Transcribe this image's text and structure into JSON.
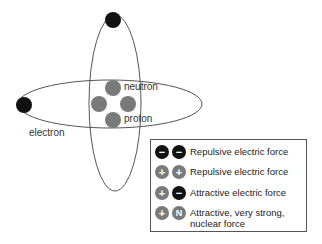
{
  "diagram": {
    "labels": {
      "neutron": "neutron",
      "proton": "proton",
      "electron": "electron"
    },
    "colors": {
      "electron": "#111111",
      "nucleon": "#7a7a7a",
      "orbit": "#555555"
    }
  },
  "legend": {
    "rows": [
      {
        "left": "−",
        "right": "−",
        "left_type": "neg",
        "right_type": "neg",
        "text": "Repulsive electric force"
      },
      {
        "left": "+",
        "right": "+",
        "left_type": "pos",
        "right_type": "pos",
        "text": "Repulsive electric force"
      },
      {
        "left": "+",
        "right": "−",
        "left_type": "pos",
        "right_type": "neg",
        "text": "Attractive electric force"
      },
      {
        "left": "+",
        "right": "N",
        "left_type": "pos",
        "right_type": "neu",
        "text": "Attractive, very strong, nuclear force"
      }
    ]
  }
}
